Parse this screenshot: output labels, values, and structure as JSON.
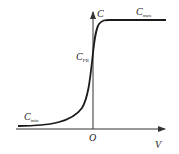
{
  "diagram": {
    "type": "C-V curve",
    "axes": {
      "y_label": "C",
      "x_label": "V",
      "origin_label": "O"
    },
    "labels": {
      "c_max": {
        "main": "C",
        "sub": "max"
      },
      "c_fb": {
        "main": "C",
        "sub": "FB"
      },
      "c_min": {
        "main": "C",
        "sub": "min"
      }
    },
    "colors": {
      "curve": "#1a1a1a",
      "axis": "#333333",
      "text": "#222222"
    }
  }
}
